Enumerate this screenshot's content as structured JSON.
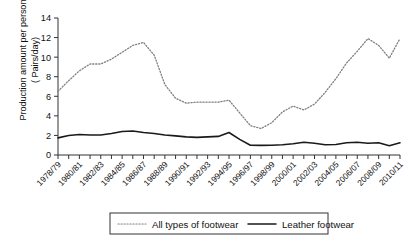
{
  "chart_data": {
    "type": "line",
    "title": "",
    "xlabel": "",
    "ylabel": "Production amount per person ( Pairs/day)",
    "ylabel_line1": "Production amount per person",
    "ylabel_line2": "( Pairs/day)",
    "ylim": [
      0,
      14
    ],
    "ytick_values": [
      0,
      2,
      4,
      6,
      8,
      10,
      12,
      14
    ],
    "ytick_labels": [
      "0",
      "2",
      "4",
      "6",
      "8",
      "10",
      "12",
      "14"
    ],
    "grid": false,
    "legend_position": "bottom-center",
    "categories": [
      "1978/79",
      "1979/80",
      "1980/81",
      "1981/82",
      "1982/83",
      "1983/84",
      "1984/85",
      "1985/86",
      "1986/87",
      "1987/88",
      "1988/89",
      "1989/90",
      "1990/91",
      "1991/92",
      "1992/93",
      "1993/94",
      "1994/95",
      "1995/96",
      "1996/97",
      "1997/98",
      "1998/99",
      "1999/00",
      "2000/01",
      "2001/02",
      "2002/03",
      "2003/04",
      "2004/05",
      "2005/06",
      "2006/07",
      "2007/08",
      "2008/09",
      "2009/10",
      "2010/11"
    ],
    "xtick_labels": [
      "1978/79",
      "1980/81",
      "1982/83",
      "1984/85",
      "1986/87",
      "1988/89",
      "1990/91",
      "1992/93",
      "1994/95",
      "1996/97",
      "1998/99",
      "2000/01",
      "2002/03",
      "2004/05",
      "2006/07",
      "2008/09",
      "2010/11"
    ],
    "series": [
      {
        "name": "All types of footwear",
        "style": "dotted",
        "color": "#808080",
        "values": [
          6.5,
          7.6,
          8.6,
          9.3,
          9.3,
          9.8,
          10.5,
          11.2,
          11.5,
          10.2,
          7.2,
          5.8,
          5.3,
          5.4,
          5.4,
          5.4,
          5.6,
          4.3,
          3.0,
          2.7,
          3.3,
          4.4,
          5.0,
          4.6,
          5.2,
          6.4,
          7.8,
          9.4,
          10.6,
          11.9,
          11.2,
          9.9,
          11.9
        ]
      },
      {
        "name": "Leather footwear",
        "style": "solid",
        "color": "#1a1a1a",
        "values": [
          1.75,
          2.0,
          2.1,
          2.05,
          2.05,
          2.2,
          2.4,
          2.45,
          2.3,
          2.2,
          2.05,
          1.95,
          1.85,
          1.8,
          1.85,
          1.9,
          2.3,
          1.6,
          1.0,
          0.98,
          1.0,
          1.05,
          1.15,
          1.3,
          1.2,
          1.05,
          1.08,
          1.25,
          1.3,
          1.2,
          1.25,
          0.95,
          1.25
        ]
      }
    ],
    "legend": [
      {
        "label": "All types of footwear",
        "style": "dotted"
      },
      {
        "label": "Leather footwear",
        "style": "solid"
      }
    ]
  }
}
